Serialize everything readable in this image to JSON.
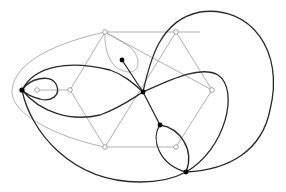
{
  "diagram": {
    "type": "planar-graph-embedding",
    "colors": {
      "background": "#ffffff",
      "gray_edges": "#a8a8a8",
      "black_edges": "#2a2a2a",
      "solid_nodes": "#000000",
      "open_node_stroke": "#9a9a9a"
    },
    "gray_nodes": [
      {
        "id": "g-top-left",
        "x": 105,
        "y": 32
      },
      {
        "id": "g-top-right",
        "x": 176,
        "y": 32
      },
      {
        "id": "g-right",
        "x": 212,
        "y": 90
      },
      {
        "id": "g-bottom-right",
        "x": 176,
        "y": 147
      },
      {
        "id": "g-bottom-left",
        "x": 105,
        "y": 147
      },
      {
        "id": "g-left",
        "x": 70,
        "y": 90
      },
      {
        "id": "g-inner-left",
        "x": 37,
        "y": 90
      },
      {
        "id": "g-lower-inner",
        "x": 175,
        "y": 148
      }
    ],
    "black_nodes": [
      {
        "id": "b-left",
        "x": 22,
        "y": 90
      },
      {
        "id": "b-center",
        "x": 143,
        "y": 92
      },
      {
        "id": "b-top-inner",
        "x": 122,
        "y": 60
      },
      {
        "id": "b-lower",
        "x": 160,
        "y": 125
      },
      {
        "id": "b-bottom",
        "x": 186,
        "y": 172
      }
    ],
    "labels": []
  }
}
